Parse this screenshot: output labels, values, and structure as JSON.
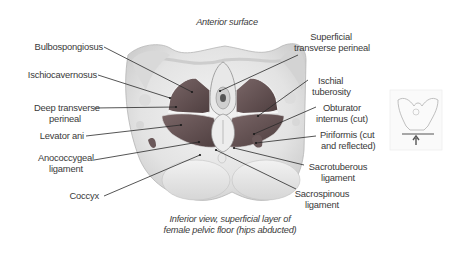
{
  "figure": {
    "top_caption": "Anterior surface",
    "bottom_caption": {
      "line1": "Inferior view, superficial layer of",
      "line2": "female pelvic floor (hips abducted)"
    },
    "colors": {
      "muscle": "#6e5a5a",
      "muscle_dark": "#4f3f40",
      "bone": "#e6e6e6",
      "outline": "#9a9a9a",
      "leader_line": "#2a2a2a",
      "text": "#3a3a3a"
    },
    "labels_left": [
      {
        "id": "bulbospongiosus",
        "line1": "Bulbospongiosus",
        "line2": ""
      },
      {
        "id": "ischiocavernosus",
        "line1": "Ischiocavernosus",
        "line2": ""
      },
      {
        "id": "deep-transverse-perineal",
        "line1": "Deep transverse",
        "line2": "perineal"
      },
      {
        "id": "levator-ani",
        "line1": "Levator ani",
        "line2": ""
      },
      {
        "id": "anococcygeal-ligament",
        "line1": "Anococcygeal",
        "line2": "ligament"
      },
      {
        "id": "coccyx",
        "line1": "Coccyx",
        "line2": ""
      }
    ],
    "labels_right": [
      {
        "id": "superficial-transverse-perineal",
        "line1": "Superficial",
        "line2": "transverse perineal"
      },
      {
        "id": "ischial-tuberosity",
        "line1": "Ischial",
        "line2": "tuberosity"
      },
      {
        "id": "obturator-internus",
        "line1": "Obturator",
        "line2": "internus (cut)"
      },
      {
        "id": "piriformis",
        "line1": "Piriformis (cut",
        "line2": "and reflected)"
      },
      {
        "id": "sacrotuberous-ligament",
        "line1": "Sacrotuberous",
        "line2": "ligament"
      },
      {
        "id": "sacrospinous-ligament",
        "line1": "Sacrospinous",
        "line2": "ligament"
      }
    ],
    "orientation_thumbnail": {
      "icon": "pelvis-view-arrow-icon",
      "description": "Small pelvis outline with upward arrow indicating inferior viewing direction"
    }
  }
}
